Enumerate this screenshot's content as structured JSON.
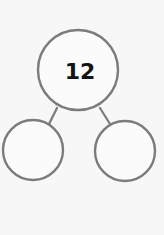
{
  "diagram": {
    "type": "number-bond",
    "colors": {
      "background": "#f7f7f7",
      "stroke": "#7b7b7b",
      "node_fill": "#fbfbfb",
      "text": "#141414"
    },
    "whole": {
      "label": "12",
      "cx": 78,
      "cy": 70,
      "r": 40
    },
    "parts": [
      {
        "label": "",
        "cx": 33,
        "cy": 150,
        "r": 30
      },
      {
        "label": "",
        "cx": 125,
        "cy": 151,
        "r": 30
      }
    ],
    "connectors": [
      {
        "x1": 57,
        "y1": 108,
        "x2": 49,
        "y2": 124
      },
      {
        "x1": 100,
        "y1": 108,
        "x2": 110,
        "y2": 124
      }
    ]
  }
}
